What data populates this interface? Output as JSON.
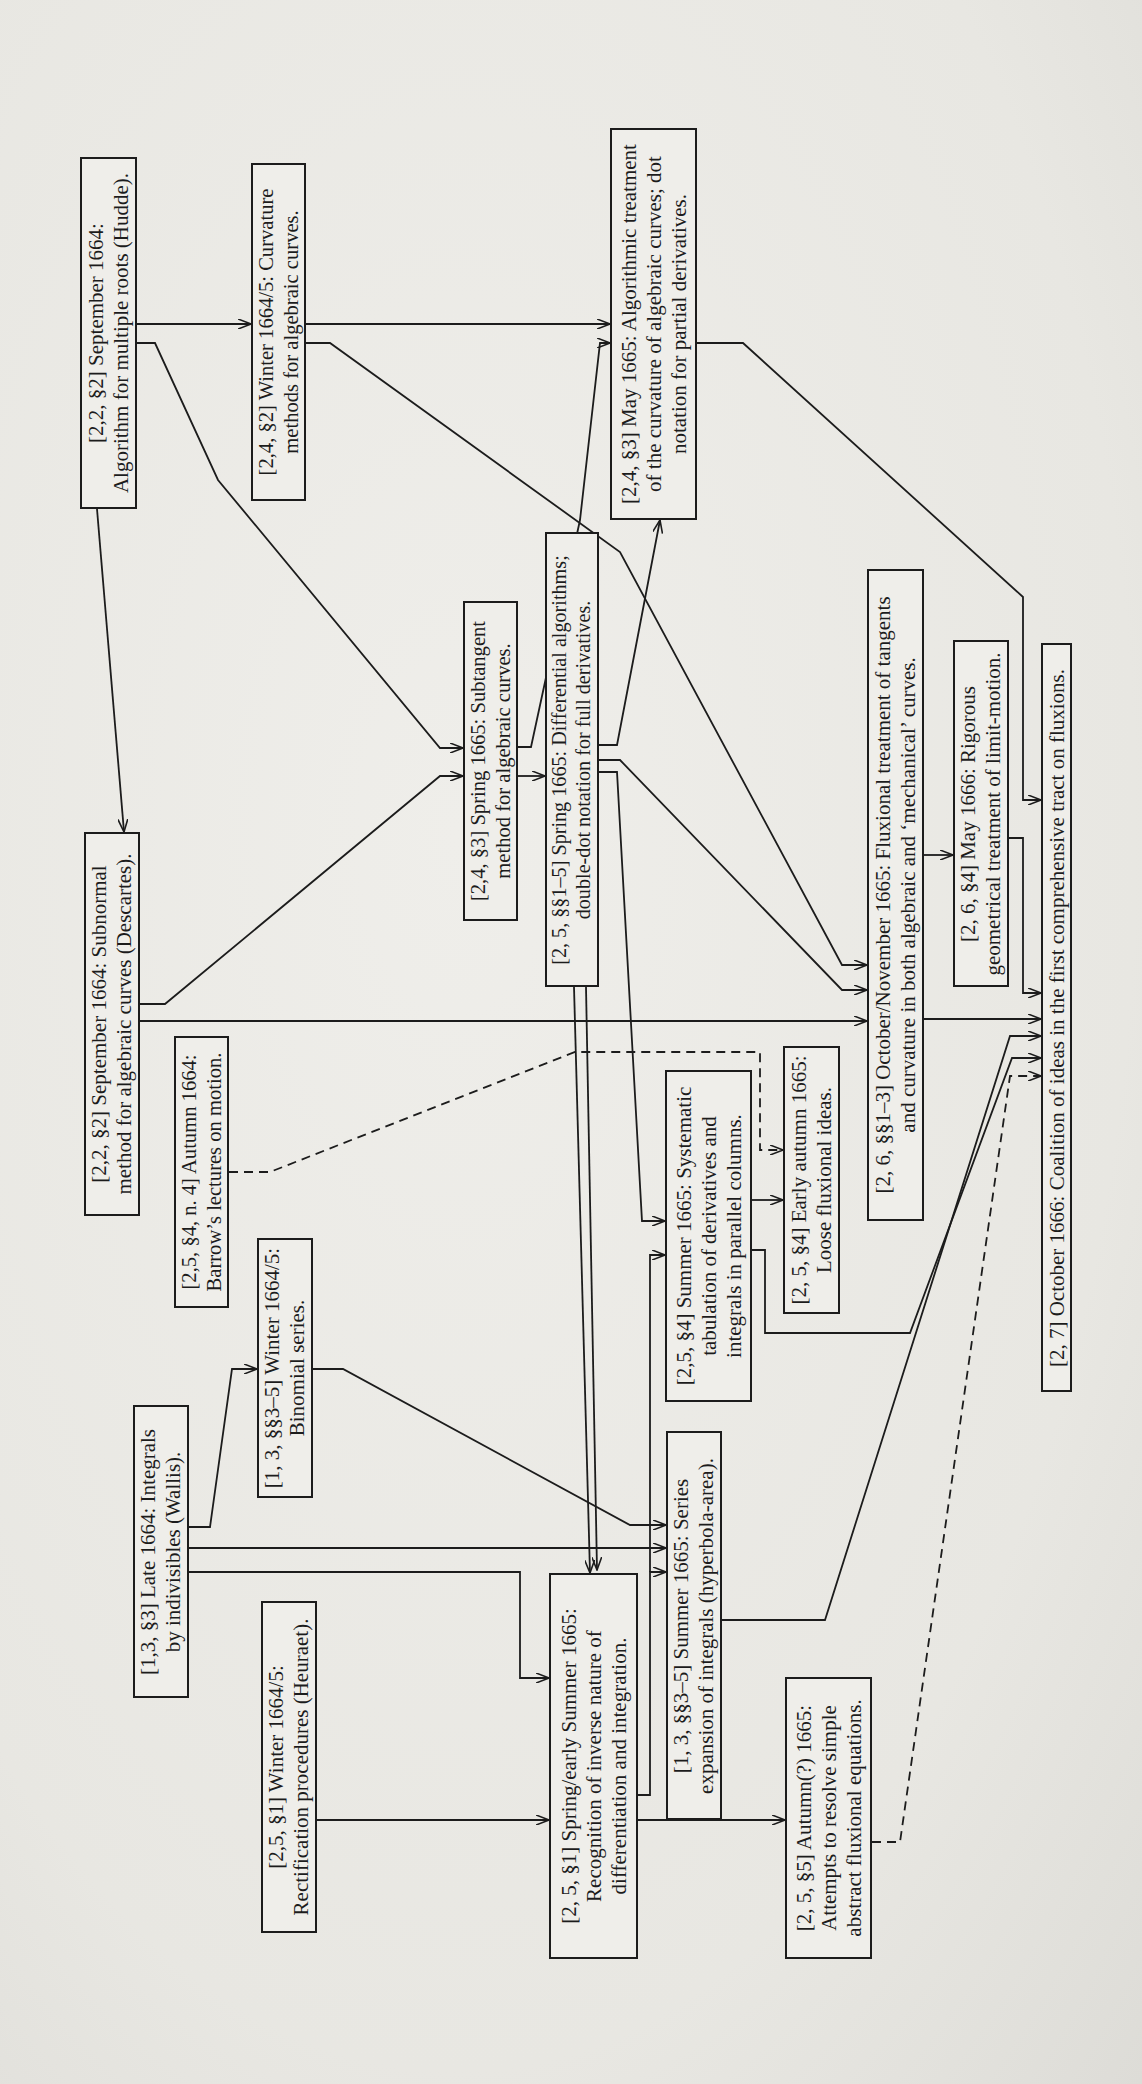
{
  "diagram": {
    "title": "",
    "orientation": "rotated-90-ccw",
    "nodes": [
      {
        "id": "hudde",
        "ref": "[2,2, §2]",
        "lines": [
          "[2,2, §2] September 1664:",
          "Algorithm for multiple roots (Hudde)."
        ],
        "x": 80,
        "y": 157,
        "w": 57,
        "h": 352
      },
      {
        "id": "curvature",
        "ref": "[2,4, §2]",
        "lines": [
          "[2,4, §2] Winter 1664/5: Curvature",
          "methods for algebraic curves."
        ],
        "x": 251,
        "y": 163,
        "w": 55,
        "h": 338
      },
      {
        "id": "may1665",
        "ref": "[2,4, §3]",
        "lines": [
          "[2,4, §3] May 1665: Algorithmic treatment",
          "of the curvature of algebraic curves; dot",
          "notation for partial derivatives."
        ],
        "x": 610,
        "y": 128,
        "w": 87,
        "h": 392
      },
      {
        "id": "subtangent",
        "ref": "[2,4, §3]",
        "lines": [
          "[2,4, §3] Spring 1665: Subtangent",
          "method for algebraic curves."
        ],
        "x": 463,
        "y": 601,
        "w": 55,
        "h": 320
      },
      {
        "id": "differential",
        "ref": "[2,5, §§1–5]",
        "lines": [
          "[2, 5, §§1–5] Spring 1665: Differential algorithms;",
          "double-dot notation for full derivatives."
        ],
        "x": 545,
        "y": 532,
        "w": 54,
        "h": 455
      },
      {
        "id": "subnormal",
        "ref": "[2,2, §2]",
        "lines": [
          "[2,2, §2] September 1664: Subnormal",
          "method for algebraic curves (Descartes)."
        ],
        "x": 84,
        "y": 832,
        "w": 56,
        "h": 384
      },
      {
        "id": "barrow",
        "ref": "[2,5, §4, n. 4]",
        "lines": [
          "[2,5, §4, n. 4]  Autumn 1664:",
          "Barrow’s lectures on motion."
        ],
        "x": 174,
        "y": 1036,
        "w": 55,
        "h": 272
      },
      {
        "id": "octnov",
        "ref": "[2,6, §§1–3]",
        "lines": [
          "[2, 6, §§1–3] October/November 1665: Fluxional treatment of tangents",
          "and curvature in both algebraic and ‘mechanical’ curves."
        ],
        "x": 867,
        "y": 569,
        "w": 57,
        "h": 652
      },
      {
        "id": "may1666",
        "ref": "[2,6, §4]",
        "lines": [
          "[2, 6, §4] May 1666: Rigorous",
          "geometrical treatment of limit-motion."
        ],
        "x": 953,
        "y": 640,
        "w": 56,
        "h": 347
      },
      {
        "id": "coalition",
        "ref": "[2,7]",
        "lines": [
          "[2, 7] October 1666: Coalition of ideas in the first comprehensive tract on fluxions."
        ],
        "x": 1041,
        "y": 643,
        "w": 31,
        "h": 749
      },
      {
        "id": "systematic",
        "ref": "[2,5, §4]",
        "lines": [
          "[2,5, §4] Summer 1665: Systematic",
          "tabulation of derivatives and",
          "integrals in parallel columns."
        ],
        "x": 665,
        "y": 1070,
        "w": 87,
        "h": 332
      },
      {
        "id": "earlyautumn",
        "ref": "[2,5, §4]",
        "lines": [
          "[2, 5, §4] Early autumn 1665:",
          "Loose fluxional ideas."
        ],
        "x": 783,
        "y": 1046,
        "w": 57,
        "h": 268
      },
      {
        "id": "binomial",
        "ref": "[1,3, §§3–5]",
        "lines": [
          "[1, 3, §§3–5] Winter 1664/5:",
          "Binomial series."
        ],
        "x": 257,
        "y": 1238,
        "w": 56,
        "h": 260
      },
      {
        "id": "wallis",
        "ref": "[1,3, §3]",
        "lines": [
          "[1,3, §3] Late 1664: Integrals",
          "by indivisibles (Wallis)."
        ],
        "x": 133,
        "y": 1405,
        "w": 56,
        "h": 293
      },
      {
        "id": "series",
        "ref": "[1,3, §§3–5]",
        "lines": [
          "[1, 3, §§3–5] Summer 1665: Series",
          "expansion of integrals (hyperbola-area)."
        ],
        "x": 666,
        "y": 1431,
        "w": 56,
        "h": 389
      },
      {
        "id": "heuraet",
        "ref": "[2,5, §1]",
        "lines": [
          "[2,5, §1]  Winter 1664/5:",
          "Rectification procedures (Heuraet)."
        ],
        "x": 261,
        "y": 1601,
        "w": 56,
        "h": 332
      },
      {
        "id": "inverse",
        "ref": "[2,5, §1]",
        "lines": [
          "[2, 5, §1] Spring/early Summer 1665:",
          "Recognition of inverse nature of",
          "differentiation and integration."
        ],
        "x": 549,
        "y": 1573,
        "w": 89,
        "h": 386
      },
      {
        "id": "autumn",
        "ref": "[2,5, §5]",
        "lines": [
          "[2, 5, §5] Autumn(?) 1665:",
          "Attempts to resolve simple",
          "abstract fluxional equations."
        ],
        "x": 785,
        "y": 1677,
        "w": 87,
        "h": 282
      }
    ],
    "edges": [
      {
        "from": "hudde",
        "to": "curvature",
        "style": "solid",
        "points": [
          [
            137,
            324
          ],
          [
            251,
            324
          ]
        ]
      },
      {
        "from": "curvature",
        "to": "may1665",
        "style": "solid",
        "points": [
          [
            306,
            324
          ],
          [
            610,
            324
          ]
        ]
      },
      {
        "from": "hudde",
        "to": "subtangent",
        "style": "solid",
        "points": [
          [
            137,
            343
          ],
          [
            155,
            343
          ],
          [
            218,
            480
          ],
          [
            440,
            748
          ],
          [
            463,
            748
          ]
        ]
      },
      {
        "from": "hudde",
        "to": "subnormal",
        "style": "solid",
        "points": [
          [
            97,
            509
          ],
          [
            124,
            832
          ]
        ]
      },
      {
        "from": "curvature",
        "to": "octnov",
        "style": "solid",
        "points": [
          [
            306,
            343
          ],
          [
            330,
            343
          ],
          [
            620,
            552
          ],
          [
            842,
            965
          ],
          [
            867,
            965
          ]
        ]
      },
      {
        "from": "may1665",
        "to": "coalition",
        "style": "solid",
        "points": [
          [
            697,
            343
          ],
          [
            743,
            343
          ],
          [
            1023,
            597
          ],
          [
            1023,
            800
          ],
          [
            1041,
            800
          ]
        ]
      },
      {
        "from": "subtangent",
        "to": "may1665",
        "style": "solid",
        "points": [
          [
            518,
            747
          ],
          [
            531,
            747
          ],
          [
            580,
            520
          ],
          [
            600,
            343
          ],
          [
            610,
            343
          ]
        ]
      },
      {
        "from": "subtangent",
        "to": "differential",
        "style": "solid",
        "points": [
          [
            518,
            776
          ],
          [
            545,
            776
          ]
        ]
      },
      {
        "from": "subnormal",
        "to": "subtangent",
        "style": "solid",
        "points": [
          [
            140,
            1004
          ],
          [
            165,
            1004
          ],
          [
            440,
            776
          ],
          [
            463,
            776
          ]
        ]
      },
      {
        "from": "subnormal",
        "to": "octnov",
        "style": "solid",
        "points": [
          [
            140,
            1021
          ],
          [
            867,
            1021
          ]
        ]
      },
      {
        "from": "differential",
        "to": "may1665",
        "style": "solid",
        "points": [
          [
            599,
            745
          ],
          [
            617,
            745
          ],
          [
            660,
            520
          ]
        ]
      },
      {
        "from": "differential",
        "to": "octnov",
        "style": "solid",
        "points": [
          [
            599,
            760
          ],
          [
            620,
            760
          ],
          [
            842,
            990
          ],
          [
            867,
            990
          ]
        ]
      },
      {
        "from": "differential",
        "to": "systematic",
        "style": "solid",
        "points": [
          [
            599,
            772
          ],
          [
            617,
            772
          ],
          [
            642,
            1221
          ],
          [
            665,
            1221
          ]
        ]
      },
      {
        "from": "differential",
        "to": "inverse",
        "style": "solid",
        "points": [
          [
            574,
            987
          ],
          [
            590,
            1573
          ]
        ]
      },
      {
        "from": "barrow",
        "to": "earlyautumn",
        "style": "dashed",
        "points": [
          [
            229,
            1172
          ],
          [
            270,
            1172
          ],
          [
            575,
            1052
          ],
          [
            760,
            1052
          ],
          [
            760,
            1150
          ],
          [
            783,
            1150
          ]
        ]
      },
      {
        "from": "octnov",
        "to": "may1666",
        "style": "solid",
        "points": [
          [
            924,
            855
          ],
          [
            953,
            855
          ]
        ]
      },
      {
        "from": "octnov",
        "to": "coalition",
        "style": "solid",
        "points": [
          [
            924,
            1019
          ],
          [
            1041,
            1019
          ]
        ]
      },
      {
        "from": "may1666",
        "to": "coalition",
        "style": "solid",
        "points": [
          [
            1009,
            838
          ],
          [
            1023,
            838
          ],
          [
            1023,
            993
          ],
          [
            1041,
            993
          ]
        ]
      },
      {
        "from": "systematic",
        "to": "earlyautumn",
        "style": "solid",
        "points": [
          [
            752,
            1200
          ],
          [
            783,
            1200
          ]
        ]
      },
      {
        "from": "systematic",
        "to": "coalition",
        "style": "solid",
        "points": [
          [
            752,
            1250
          ],
          [
            765,
            1250
          ],
          [
            765,
            1333
          ],
          [
            910,
            1333
          ],
          [
            1012,
            1058
          ],
          [
            1041,
            1058
          ]
        ]
      },
      {
        "from": "series",
        "to": "coalition",
        "style": "solid",
        "points": [
          [
            722,
            1620
          ],
          [
            825,
            1620
          ],
          [
            1010,
            1036
          ],
          [
            1041,
            1036
          ]
        ]
      },
      {
        "from": "autumn",
        "to": "coalition",
        "style": "dashed",
        "points": [
          [
            872,
            1842
          ],
          [
            900,
            1842
          ],
          [
            1010,
            1076
          ],
          [
            1041,
            1076
          ]
        ]
      },
      {
        "from": "binomial",
        "to": "series",
        "style": "solid",
        "points": [
          [
            313,
            1369
          ],
          [
            343,
            1369
          ],
          [
            630,
            1525
          ],
          [
            666,
            1525
          ]
        ]
      },
      {
        "from": "wallis",
        "to": "binomial",
        "style": "solid",
        "points": [
          [
            189,
            1527
          ],
          [
            210,
            1527
          ],
          [
            232,
            1369
          ],
          [
            257,
            1369
          ]
        ]
      },
      {
        "from": "wallis",
        "to": "series",
        "style": "solid",
        "points": [
          [
            189,
            1548
          ],
          [
            666,
            1548
          ]
        ]
      },
      {
        "from": "wallis",
        "to": "inverse",
        "style": "solid",
        "points": [
          [
            189,
            1572
          ],
          [
            520,
            1572
          ],
          [
            520,
            1678
          ],
          [
            549,
            1678
          ]
        ]
      },
      {
        "from": "heuraet",
        "to": "inverse",
        "style": "solid",
        "points": [
          [
            317,
            1820
          ],
          [
            549,
            1820
          ]
        ]
      },
      {
        "from": "inverse",
        "to": "autumn",
        "style": "solid",
        "points": [
          [
            638,
            1820
          ],
          [
            785,
            1820
          ]
        ]
      },
      {
        "from": "inverse",
        "to": "series",
        "style": "solid",
        "points": [
          [
            638,
            1795
          ],
          [
            650,
            1795
          ],
          [
            650,
            1572
          ],
          [
            666,
            1572
          ]
        ]
      },
      {
        "from": "differential",
        "to": "systematic-alt",
        "style": "solid",
        "points": [
          [
            586,
            987
          ],
          [
            597,
            1570
          ]
        ]
      },
      {
        "from": "inverse",
        "to": "systematic",
        "style": "solid",
        "points": [
          [
            650,
            1572
          ],
          [
            650,
            1255
          ],
          [
            665,
            1255
          ]
        ]
      }
    ]
  }
}
